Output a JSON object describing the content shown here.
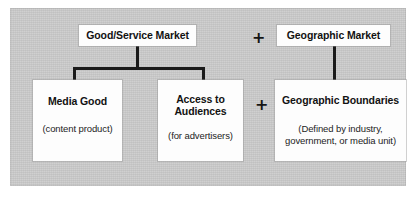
{
  "diagram": {
    "background_color": "#c9c9c9",
    "box_fill_color": "#fdfdfd",
    "line_color": "#1a1a1a",
    "operators": {
      "top_plus": "+",
      "bottom_plus": "+"
    },
    "nodes": {
      "good_service_market": {
        "title": "Good/Service Market",
        "subtitle": ""
      },
      "geographic_market": {
        "title": "Geographic Market",
        "subtitle": ""
      },
      "media_good": {
        "title": "Media Good",
        "subtitle": "(content product)"
      },
      "access_to_audiences": {
        "title_line1": "Access to",
        "title_line2": "Audiences",
        "subtitle": "(for advertisers)"
      },
      "geographic_boundaries": {
        "title": "Geographic Boundaries",
        "subtitle_line1": "(Defined by industry,",
        "subtitle_line2": "government, or media unit)"
      }
    }
  }
}
